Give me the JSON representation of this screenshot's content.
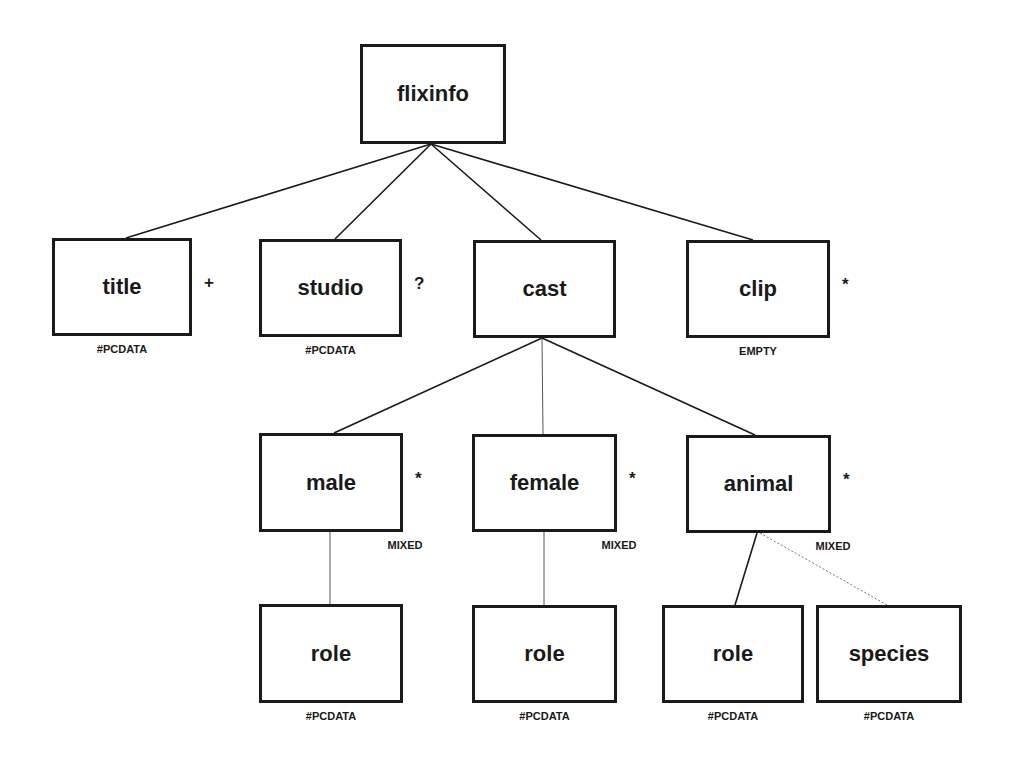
{
  "diagram": {
    "type": "dtd-tree",
    "nodes": [
      {
        "id": "flixinfo",
        "label": "flixinfo",
        "cardinality": "",
        "content_type": "",
        "x": 360,
        "y": 44,
        "w": 146,
        "h": 100
      },
      {
        "id": "title",
        "label": "title",
        "cardinality": "+",
        "content_type": "#PCDATA",
        "x": 52,
        "y": 238,
        "w": 140,
        "h": 98
      },
      {
        "id": "studio",
        "label": "studio",
        "cardinality": "?",
        "content_type": "#PCDATA",
        "x": 259,
        "y": 239,
        "w": 143,
        "h": 98
      },
      {
        "id": "cast",
        "label": "cast",
        "cardinality": "",
        "content_type": "",
        "x": 473,
        "y": 240,
        "w": 143,
        "h": 98
      },
      {
        "id": "clip",
        "label": "clip",
        "cardinality": "*",
        "content_type": "EMPTY",
        "x": 686,
        "y": 240,
        "w": 144,
        "h": 98
      },
      {
        "id": "male",
        "label": "male",
        "cardinality": "*",
        "content_type": "MIXED",
        "x": 259,
        "y": 433,
        "w": 144,
        "h": 99
      },
      {
        "id": "female",
        "label": "female",
        "cardinality": "*",
        "content_type": "MIXED",
        "x": 472,
        "y": 434,
        "w": 145,
        "h": 98
      },
      {
        "id": "animal",
        "label": "animal",
        "cardinality": "*",
        "content_type": "MIXED",
        "x": 686,
        "y": 435,
        "w": 145,
        "h": 98
      },
      {
        "id": "role_male",
        "label": "role",
        "cardinality": "",
        "content_type": "#PCDATA",
        "x": 259,
        "y": 604,
        "w": 144,
        "h": 99
      },
      {
        "id": "role_female",
        "label": "role",
        "cardinality": "",
        "content_type": "#PCDATA",
        "x": 472,
        "y": 605,
        "w": 145,
        "h": 98
      },
      {
        "id": "role_animal",
        "label": "role",
        "cardinality": "",
        "content_type": "#PCDATA",
        "x": 662,
        "y": 605,
        "w": 142,
        "h": 98
      },
      {
        "id": "species",
        "label": "species",
        "cardinality": "",
        "content_type": "#PCDATA",
        "x": 816,
        "y": 605,
        "w": 146,
        "h": 98
      }
    ],
    "edges": [
      {
        "from": "flixinfo",
        "to": "title",
        "x1": 431,
        "y1": 144,
        "x2": 126,
        "y2": 238,
        "style": "solid"
      },
      {
        "from": "flixinfo",
        "to": "studio",
        "x1": 431,
        "y1": 144,
        "x2": 335,
        "y2": 239,
        "style": "solid"
      },
      {
        "from": "flixinfo",
        "to": "cast",
        "x1": 431,
        "y1": 144,
        "x2": 541,
        "y2": 240,
        "style": "solid"
      },
      {
        "from": "flixinfo",
        "to": "clip",
        "x1": 431,
        "y1": 144,
        "x2": 753,
        "y2": 240,
        "style": "solid"
      },
      {
        "from": "cast",
        "to": "male",
        "x1": 542,
        "y1": 338,
        "x2": 334,
        "y2": 433,
        "style": "solid"
      },
      {
        "from": "cast",
        "to": "female",
        "x1": 542,
        "y1": 338,
        "x2": 543,
        "y2": 434,
        "style": "thin"
      },
      {
        "from": "cast",
        "to": "animal",
        "x1": 542,
        "y1": 338,
        "x2": 755,
        "y2": 435,
        "style": "solid"
      },
      {
        "from": "male",
        "to": "role_male",
        "x1": 330,
        "y1": 532,
        "x2": 330,
        "y2": 604,
        "style": "thin"
      },
      {
        "from": "female",
        "to": "role_female",
        "x1": 544,
        "y1": 532,
        "x2": 544,
        "y2": 605,
        "style": "thin"
      },
      {
        "from": "animal",
        "to": "role_animal",
        "x1": 757,
        "y1": 533,
        "x2": 735,
        "y2": 605,
        "style": "solid"
      },
      {
        "from": "animal",
        "to": "species",
        "x1": 760,
        "y1": 533,
        "x2": 887,
        "y2": 605,
        "style": "dotted"
      }
    ]
  }
}
